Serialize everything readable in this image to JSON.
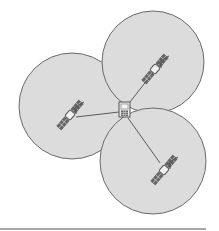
{
  "diagram": {
    "colors": {
      "circle_fill": "#dcdcdc",
      "circle_stroke": "#6a6a6a",
      "line": "#5a5a5a",
      "icon": "#555555",
      "rule": "#8a8a8a"
    },
    "receiver": {
      "icon": "mobile-phone-icon",
      "x": 124,
      "y": 110
    },
    "satellites": [
      {
        "name": "satellite-left",
        "icon": "satellite-icon",
        "x": 70,
        "y": 110,
        "circle": {
          "cx": 72,
          "cy": 106,
          "r": 53
        }
      },
      {
        "name": "satellite-top",
        "icon": "satellite-icon",
        "x": 160,
        "y": 64,
        "circle": {
          "cx": 153,
          "cy": 62,
          "r": 51
        }
      },
      {
        "name": "satellite-bottom",
        "icon": "satellite-icon",
        "x": 165,
        "y": 165,
        "circle": {
          "cx": 153,
          "cy": 161,
          "r": 53
        }
      }
    ]
  }
}
